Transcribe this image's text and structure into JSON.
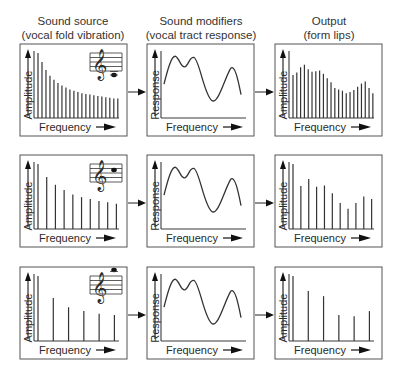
{
  "columns": [
    {
      "title_line1": "Sound source",
      "title_line2": "(vocal fold vibration)",
      "ylabel": "Amplitude",
      "xlabel": "Frequency"
    },
    {
      "title_line1": "Sound modifiers",
      "title_line2": "(vocal tract response)",
      "ylabel": "Response",
      "xlabel": "Frequency"
    },
    {
      "title_line1": "Output",
      "title_line2": "(form lips)",
      "ylabel": "Amplitude",
      "xlabel": "Frequency"
    }
  ],
  "icons": {
    "flow_arrow": "right-arrow-icon",
    "staff": "treble-clef-staff-icon"
  },
  "chart_data": [
    {
      "type": "bar",
      "row": 1,
      "panel": "source",
      "title": "Sound source (vocal fold vibration)",
      "xlabel": "Frequency",
      "ylabel": "Amplitude",
      "values": [
        100,
        86,
        74,
        65,
        59,
        54,
        50,
        47,
        44,
        42,
        40,
        38,
        37,
        36,
        35,
        34,
        33,
        32,
        31,
        30,
        30
      ],
      "note": "low pitch (many closely spaced harmonics)"
    },
    {
      "type": "line",
      "row": 1,
      "panel": "modifier",
      "title": "Sound modifiers (vocal tract response)",
      "xlabel": "Frequency",
      "ylabel": "Response",
      "curve": "three formant peaks"
    },
    {
      "type": "bar",
      "row": 1,
      "panel": "output",
      "title": "Output (form lips)",
      "xlabel": "Frequency",
      "ylabel": "Amplitude",
      "values": [
        66,
        70,
        78,
        82,
        75,
        71,
        72,
        73,
        68,
        61,
        55,
        46,
        44,
        42,
        38,
        40,
        43,
        48,
        53,
        56,
        46,
        38
      ]
    },
    {
      "type": "bar",
      "row": 2,
      "panel": "source",
      "xlabel": "Frequency",
      "ylabel": "Amplitude",
      "values": [
        100,
        80,
        68,
        60,
        53,
        49,
        46,
        43,
        41,
        39
      ],
      "note": "mid pitch"
    },
    {
      "type": "line",
      "row": 2,
      "panel": "modifier",
      "xlabel": "Frequency",
      "ylabel": "Response",
      "curve": "three formant peaks"
    },
    {
      "type": "bar",
      "row": 2,
      "panel": "output",
      "xlabel": "Frequency",
      "ylabel": "Amplitude",
      "values": [
        100,
        66,
        77,
        65,
        67,
        55,
        40,
        31,
        40,
        50,
        46
      ]
    },
    {
      "type": "bar",
      "row": 3,
      "panel": "source",
      "xlabel": "Frequency",
      "ylabel": "Amplitude",
      "values": [
        100,
        66,
        52,
        46,
        42,
        40
      ],
      "note": "high pitch"
    },
    {
      "type": "line",
      "row": 3,
      "panel": "modifier",
      "xlabel": "Frequency",
      "ylabel": "Response",
      "curve": "three formant peaks"
    },
    {
      "type": "bar",
      "row": 3,
      "panel": "output",
      "xlabel": "Frequency",
      "ylabel": "Amplitude",
      "values": [
        100,
        77,
        69,
        40,
        38,
        46
      ]
    }
  ]
}
